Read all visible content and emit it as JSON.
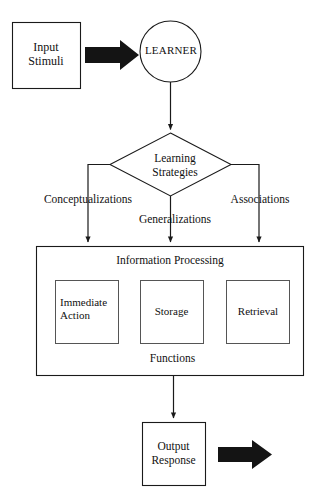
{
  "diagram": {
    "nodes": {
      "input_stimuli": {
        "label": "Input\nStimuli",
        "shape": "rectangle"
      },
      "learner": {
        "label": "LEARNER",
        "shape": "circle"
      },
      "learning_strategies": {
        "label": "Learning\nStrategies",
        "shape": "diamond"
      },
      "information_processing": {
        "label": "Information Processing",
        "shape": "rectangle"
      },
      "immediate_action": {
        "label": "Immediate\nAction",
        "shape": "rectangle"
      },
      "storage": {
        "label": "Storage",
        "shape": "rectangle"
      },
      "retrieval": {
        "label": "Retrieval",
        "shape": "rectangle"
      },
      "functions": {
        "label": "Functions",
        "shape": "text"
      },
      "output_response": {
        "label": "Output\nResponse",
        "shape": "rectangle"
      }
    },
    "edge_labels": {
      "left_branch": "Conceptualizations",
      "center_branch": "Generalizations",
      "right_branch": "Associations"
    },
    "arrows": {
      "input_to_learner": "bold-right-arrow",
      "output_outgoing": "bold-right-arrow"
    },
    "colors": {
      "stroke": "#1a1a1a",
      "bold_arrow_fill": "#141414",
      "background": "#ffffff",
      "text": "#111111"
    }
  }
}
